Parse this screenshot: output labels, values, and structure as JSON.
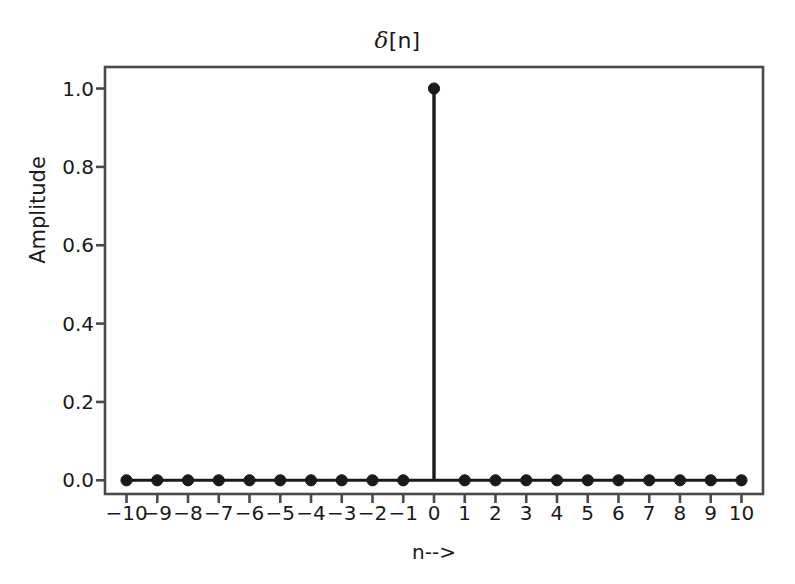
{
  "chart_data": {
    "type": "stem",
    "title": "δ[n]",
    "title_symbol": "δ",
    "title_rest": "[n]",
    "xlabel": "n-->",
    "ylabel": "Amplitude",
    "x": [
      -10,
      -9,
      -8,
      -7,
      -6,
      -5,
      -4,
      -3,
      -2,
      -1,
      0,
      1,
      2,
      3,
      4,
      5,
      6,
      7,
      8,
      9,
      10
    ],
    "values": [
      0,
      0,
      0,
      0,
      0,
      0,
      0,
      0,
      0,
      0,
      1,
      0,
      0,
      0,
      0,
      0,
      0,
      0,
      0,
      0,
      0
    ],
    "xtick_labels": [
      "−10",
      "−9",
      "−8",
      "−7",
      "−6",
      "−5",
      "−4",
      "−3",
      "−2",
      "−1",
      "0",
      "1",
      "2",
      "3",
      "4",
      "5",
      "6",
      "7",
      "8",
      "9",
      "10"
    ],
    "ytick_labels": [
      "0.0",
      "0.2",
      "0.4",
      "0.6",
      "0.8",
      "1.0"
    ],
    "ytick_values": [
      0.0,
      0.2,
      0.4,
      0.6,
      0.8,
      1.0
    ],
    "xlim": [
      -10.7,
      10.7
    ],
    "ylim": [
      -0.035,
      1.055
    ],
    "grid": false,
    "legend": false,
    "marker": "filled-circle",
    "marker_color": "#1a1a1a",
    "line_color": "#1a1a1a",
    "baseline_color": "#1a1a1a",
    "frame_color": "#4a4a4a",
    "background": "#ffffff"
  }
}
